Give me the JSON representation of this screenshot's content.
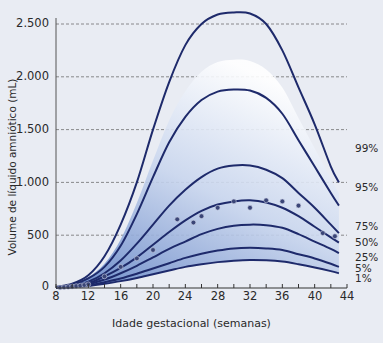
{
  "chart_data": {
    "type": "line",
    "title": "",
    "xlabel": "Idade gestacional (semanas)",
    "ylabel": "Volume de líquido amniótico (mL)",
    "xlim": [
      8,
      44
    ],
    "ylim": [
      0,
      2500
    ],
    "grid": "horizontal dashed",
    "x_ticks": [
      "8",
      "12",
      "16",
      "20",
      "24",
      "28",
      "32",
      "36",
      "40",
      "44"
    ],
    "y_ticks": [
      "0",
      "500",
      "1.000",
      "1.500",
      "2.000",
      "2.500"
    ],
    "x": [
      8,
      10,
      12,
      14,
      16,
      18,
      20,
      22,
      24,
      26,
      28,
      30,
      32,
      34,
      36,
      38,
      40,
      42,
      43
    ],
    "series": [
      {
        "name": "99%",
        "values": [
          10,
          40,
          120,
          300,
          600,
          1000,
          1500,
          1950,
          2300,
          2500,
          2590,
          2610,
          2600,
          2500,
          2250,
          1900,
          1550,
          1150,
          1000
        ]
      },
      {
        "name": "95%",
        "values": [
          8,
          30,
          90,
          200,
          400,
          700,
          1050,
          1380,
          1620,
          1780,
          1860,
          1880,
          1870,
          1800,
          1650,
          1400,
          1150,
          900,
          780
        ]
      },
      {
        "name": "75%",
        "values": [
          6,
          20,
          60,
          140,
          260,
          420,
          600,
          780,
          930,
          1050,
          1130,
          1160,
          1160,
          1120,
          1040,
          900,
          760,
          600,
          520
        ]
      },
      {
        "name": "50%",
        "values": [
          5,
          15,
          45,
          110,
          190,
          290,
          410,
          530,
          640,
          730,
          790,
          820,
          830,
          810,
          760,
          680,
          580,
          480,
          430
        ]
      },
      {
        "name": "25%",
        "values": [
          4,
          12,
          35,
          80,
          140,
          210,
          290,
          370,
          440,
          510,
          560,
          590,
          600,
          595,
          570,
          510,
          440,
          370,
          330
        ]
      },
      {
        "name": "5%",
        "values": [
          3,
          9,
          25,
          55,
          90,
          135,
          185,
          235,
          285,
          325,
          355,
          375,
          380,
          375,
          360,
          320,
          280,
          230,
          200
        ]
      },
      {
        "name": "1%",
        "values": [
          2,
          7,
          18,
          40,
          65,
          95,
          130,
          165,
          200,
          225,
          245,
          258,
          265,
          262,
          250,
          225,
          195,
          160,
          140
        ]
      }
    ],
    "scatter": {
      "name": "observações",
      "points": [
        [
          8.5,
          5
        ],
        [
          9,
          8
        ],
        [
          9.5,
          10
        ],
        [
          10,
          14
        ],
        [
          10.5,
          18
        ],
        [
          11,
          22
        ],
        [
          11.5,
          28
        ],
        [
          12,
          35
        ],
        [
          14,
          110
        ],
        [
          16,
          200
        ],
        [
          18,
          280
        ],
        [
          20,
          360
        ],
        [
          23,
          650
        ],
        [
          25,
          620
        ],
        [
          26,
          680
        ],
        [
          28,
          760
        ],
        [
          30,
          820
        ],
        [
          32,
          760
        ],
        [
          34,
          830
        ],
        [
          36,
          820
        ],
        [
          38,
          780
        ],
        [
          41,
          520
        ],
        [
          42.5,
          490
        ]
      ]
    },
    "legend_position": "right (inline labels)"
  },
  "axis": {
    "ylabel": "Volume de líquido amniótico (mL)",
    "xlabel": "Idade gestacional (semanas)",
    "y_ticks": [
      "2.500",
      "2.000",
      "1.500",
      "1.000",
      "500",
      "0"
    ],
    "x_ticks": [
      "8",
      "12",
      "16",
      "20",
      "24",
      "28",
      "32",
      "36",
      "40",
      "44"
    ]
  },
  "percentile_labels": [
    "99%",
    "95%",
    "75%",
    "50%",
    "25%",
    "5%",
    "1%"
  ],
  "colors": {
    "background": "#e9ecf3",
    "line": "#1e2a6b",
    "band_dark": "#5c7fc4",
    "band_light": "#ffffff",
    "grid": "#707070",
    "dot": "#3a4577"
  }
}
